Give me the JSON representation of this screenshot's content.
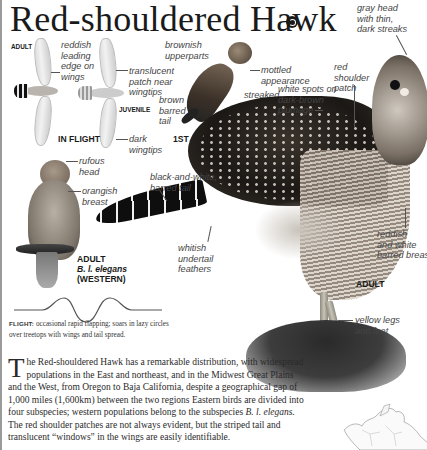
{
  "title": "Red-shouldered Hawk",
  "audio_icon": "speaker-icon",
  "sections": {
    "in_flight": {
      "caption": "IN FLIGHT",
      "adult_label": "ADULT",
      "juvenile_label": "JUVENILE",
      "labels": {
        "leading_edge": "reddish\nleading\nedge on\nwings",
        "translucent": "translucent\npatch near\nwingtips",
        "wingtips": "dark\nwingtips"
      }
    },
    "first_spring": {
      "caption": "1ST SPRING",
      "labels": {
        "upperparts": "brownish\nupperparts",
        "tail": "brown\nbarred\ntail",
        "mottled": "mottled\nappearance",
        "streaked": "streaked\nbreast"
      }
    },
    "western": {
      "caption_line1": "ADULT",
      "caption_line2": "B. l. elegans",
      "caption_line3": "(WESTERN)",
      "labels": {
        "head": "rufous\nhead",
        "breast": "orangish\nbreast"
      }
    },
    "adult": {
      "caption": "ADULT",
      "labels": {
        "gray_head": "gray head\nwith thin,\ndark streaks",
        "shoulder": "red\nshoulder\npatch",
        "white_spots": "white spots on\ndark-brown\nplumage",
        "tail": "black-and-white,\nbarred tail",
        "undertail": "whitish\nundertail\nfeathers",
        "breast": "reddish\nand white\nbarred breast",
        "legs": "yellow legs\nand feet"
      }
    }
  },
  "flight": {
    "label": "FLIGHT:",
    "text": " occasional rapid flapping; soars in lazy circles over treetops with wings and tail spread."
  },
  "description": {
    "dropcap": "T",
    "text_1": "he Red-shouldered Hawk has a remarkable distribution, with widespread populations in the East and northeast, and in the Midwest Great Plains and the West, from Oregon to Baja California, despite a geographical gap of 1,000 miles (1,600km) between the two regions Eastern birds are divided into four subspecies; western populations belong to the subspecies ",
    "italic": "B. l. elegans.",
    "text_2": " The red shoulder patches are not always evident, but the striped tail and translucent “windows” in the wings are easily identifiable."
  },
  "map": {
    "name": "range-map-north-america"
  }
}
